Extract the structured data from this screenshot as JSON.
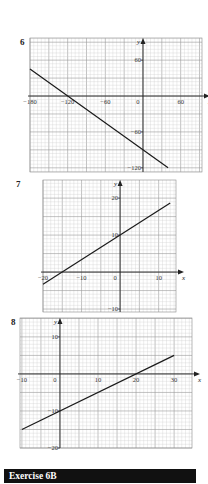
{
  "questions": [
    {
      "number": "6"
    },
    {
      "number": "7"
    },
    {
      "number": "8"
    }
  ],
  "section_banner": {
    "label": "Exercise 6B",
    "background": "#111111",
    "text_color": "#ffffff"
  },
  "chart_data": [
    {
      "type": "line",
      "title": "6",
      "xlabel": "x",
      "ylabel": "y",
      "xlim": [
        -180,
        94
      ],
      "ylim": [
        -127,
        97
      ],
      "grid": true,
      "x_ticks": [
        -180,
        -120,
        -60,
        0,
        60
      ],
      "x_tick_labels": [
        "−180",
        "−120",
        "−60",
        "0",
        "60"
      ],
      "y_ticks": [
        60,
        -60,
        -120
      ],
      "y_tick_labels": [
        "60",
        "−60",
        "−120"
      ],
      "series": [
        {
          "name": "line",
          "x": [
            -180,
            40
          ],
          "y": [
            45,
            -120
          ]
        }
      ],
      "box": {
        "left": 30,
        "right": 202,
        "top": 38,
        "bottom": 172
      },
      "minor_step": 6,
      "major_step": 30
    },
    {
      "type": "line",
      "title": "7",
      "xlabel": "x",
      "ylabel": "y",
      "xlim": [
        -20,
        14.5
      ],
      "ylim": [
        -10.8,
        24.9
      ],
      "grid": true,
      "x_ticks": [
        -20,
        -10,
        0,
        10
      ],
      "x_tick_labels": [
        "−20",
        "−10",
        "0",
        "10"
      ],
      "y_ticks": [
        20,
        10,
        -10
      ],
      "y_tick_labels": [
        "20",
        "10",
        "−10"
      ],
      "series": [
        {
          "name": "line",
          "x": [
            -20,
            13
          ],
          "y": [
            -3.3,
            18.7
          ]
        }
      ],
      "box": {
        "left": 43,
        "right": 176,
        "top": 180,
        "bottom": 312
      },
      "minor_step": 1,
      "major_step": 5
    },
    {
      "type": "line",
      "title": "8",
      "xlabel": "x",
      "ylabel": "y",
      "xlim": [
        -10.5,
        34.7
      ],
      "ylim": [
        -20.0,
        15.1
      ],
      "grid": true,
      "x_ticks": [
        -10,
        0,
        10,
        20,
        30
      ],
      "x_tick_labels": [
        "−10",
        "0",
        "10",
        "20",
        "30"
      ],
      "y_ticks": [
        10,
        -10,
        -20
      ],
      "y_tick_labels": [
        "10",
        "−10",
        "−20"
      ],
      "series": [
        {
          "name": "line",
          "x": [
            -10,
            30
          ],
          "y": [
            -15,
            5
          ]
        }
      ],
      "box": {
        "left": 20,
        "right": 192,
        "top": 318,
        "bottom": 448
      },
      "minor_step": 1,
      "major_step": 5
    }
  ]
}
